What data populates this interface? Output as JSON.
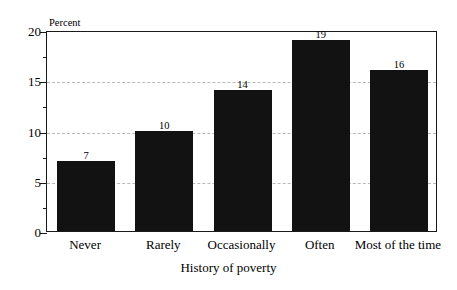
{
  "chart_data": {
    "type": "bar",
    "title": "",
    "categories": [
      "Never",
      "Rarely",
      "Occasionally",
      "Often",
      "Most of the time"
    ],
    "values": [
      7,
      10,
      14,
      19,
      16
    ],
    "value_labels": [
      "7",
      "10",
      "14",
      "19",
      "16"
    ],
    "xlabel": "History of poverty",
    "ylabel": "Percent",
    "ylim": [
      0,
      20
    ],
    "ytick_labels": [
      "0",
      "5",
      "10",
      "15",
      "20"
    ],
    "ytick_values": [
      0,
      5,
      10,
      15,
      20
    ],
    "yminor_tick_values": [
      2.5,
      7.5,
      12.5,
      17.5
    ],
    "gridlines_at": [
      5,
      10,
      15
    ],
    "grid": true,
    "legend": "none",
    "bar_color": "#121212",
    "grid_color": "#b9b9b9",
    "axis_color": "#1a1a1a"
  }
}
